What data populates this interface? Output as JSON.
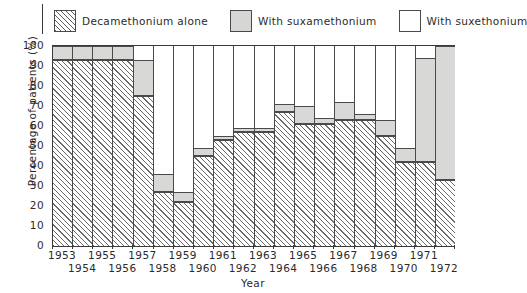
{
  "legend": {
    "items": [
      {
        "label": "Decamethonium alone",
        "swatch": "hatch-swatch",
        "color": "#ffffff"
      },
      {
        "label": "With suxamethonium",
        "swatch": "gray-swatch",
        "color": "#d8d8d6"
      },
      {
        "label": "With suxethonium",
        "swatch": "white-swatch",
        "color": "#ffffff"
      }
    ]
  },
  "axes": {
    "ylabel": "Percentage of patients (%)",
    "xlabel": "Year",
    "yticks": [
      "0",
      "10",
      "20",
      "30",
      "40",
      "50",
      "60",
      "70",
      "80",
      "90",
      "100"
    ],
    "xticks_row1": [
      "1953",
      "1955",
      "1957",
      "1959",
      "1961",
      "1963",
      "1965",
      "1967",
      "1969",
      "1971"
    ],
    "xticks_row2": [
      "1954",
      "1956",
      "1958",
      "1960",
      "1962",
      "1964",
      "1966",
      "1968",
      "1970",
      "1972"
    ]
  },
  "chart_data": {
    "type": "bar",
    "subtype": "stacked-bar",
    "title": "",
    "xlabel": "Year",
    "ylabel": "Percentage of patients (%)",
    "ylim": [
      0,
      100
    ],
    "xlim": [
      "1953",
      "1972"
    ],
    "grid": false,
    "legend_position": "top",
    "categories": [
      "1953",
      "1954",
      "1955",
      "1956",
      "1957",
      "1958",
      "1959",
      "1960",
      "1961",
      "1962",
      "1963",
      "1964",
      "1965",
      "1966",
      "1967",
      "1968",
      "1969",
      "1970",
      "1971",
      "1972"
    ],
    "series": [
      {
        "name": "Decamethonium alone",
        "fill": "hatched",
        "values": [
          93,
          93,
          93,
          93,
          75,
          27,
          22,
          45,
          53,
          57,
          57,
          67,
          61,
          61,
          63,
          63,
          55,
          42,
          42,
          33
        ]
      },
      {
        "name": "With suxamethonium",
        "fill": "gray",
        "values": [
          7,
          7,
          7,
          7,
          18,
          9,
          5,
          4,
          2,
          2,
          2,
          4,
          9,
          3,
          9,
          3,
          8,
          7,
          52,
          67
        ]
      },
      {
        "name": "With suxethonium",
        "fill": "white",
        "values": [
          0,
          0,
          0,
          0,
          7,
          64,
          73,
          51,
          45,
          41,
          41,
          29,
          30,
          36,
          28,
          34,
          37,
          51,
          6,
          0
        ]
      }
    ]
  }
}
